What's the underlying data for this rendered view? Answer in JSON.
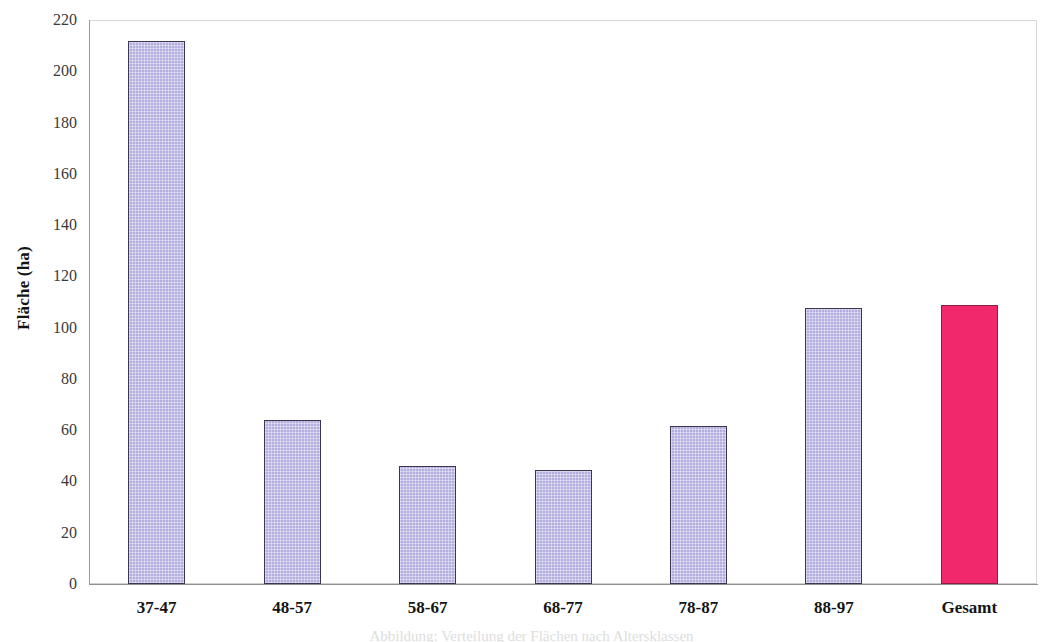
{
  "chart_data": {
    "type": "bar",
    "title": "",
    "xlabel": "",
    "ylabel": "Fläche (ha)",
    "categories": [
      "37-47",
      "48-57",
      "58-67",
      "68-77",
      "78-87",
      "88-97",
      "Gesamt"
    ],
    "values": [
      212,
      64,
      46,
      44.5,
      61.5,
      107.5,
      109
    ],
    "ylim": [
      0,
      220
    ],
    "ytick_step": 20,
    "yticks": [
      0,
      20,
      40,
      60,
      80,
      100,
      120,
      140,
      160,
      180,
      200,
      220
    ],
    "ytick_labels": [
      "0",
      "20",
      "40",
      "60",
      "80",
      "100",
      "120",
      "140",
      "160",
      "180",
      "200",
      "220"
    ],
    "grid": false,
    "legend": null,
    "series": [
      {
        "name": "Fläche",
        "values": [
          212,
          64,
          46,
          44.5,
          61.5,
          107.5,
          109
        ],
        "bar_colors": [
          "#b3aee0",
          "#b3aee0",
          "#b3aee0",
          "#b3aee0",
          "#b3aee0",
          "#b3aee0",
          "#f2286c"
        ]
      }
    ],
    "colors": {
      "bar_fill": "#b3aee0",
      "bar_border": "#3b3550",
      "accent_fill": "#f2286c",
      "accent_border": "#8e1c45",
      "axis": "#8f8f8f",
      "frame": "#cfcfcf",
      "text": "#141414",
      "tick_text": "#3a3a3a",
      "background": "#ffffff"
    }
  },
  "axes": {
    "y_title": "Fläche (ha)"
  },
  "caption": {
    "cropped_text": "Abbildung: Verteilung der Flächen nach Altersklassen"
  }
}
